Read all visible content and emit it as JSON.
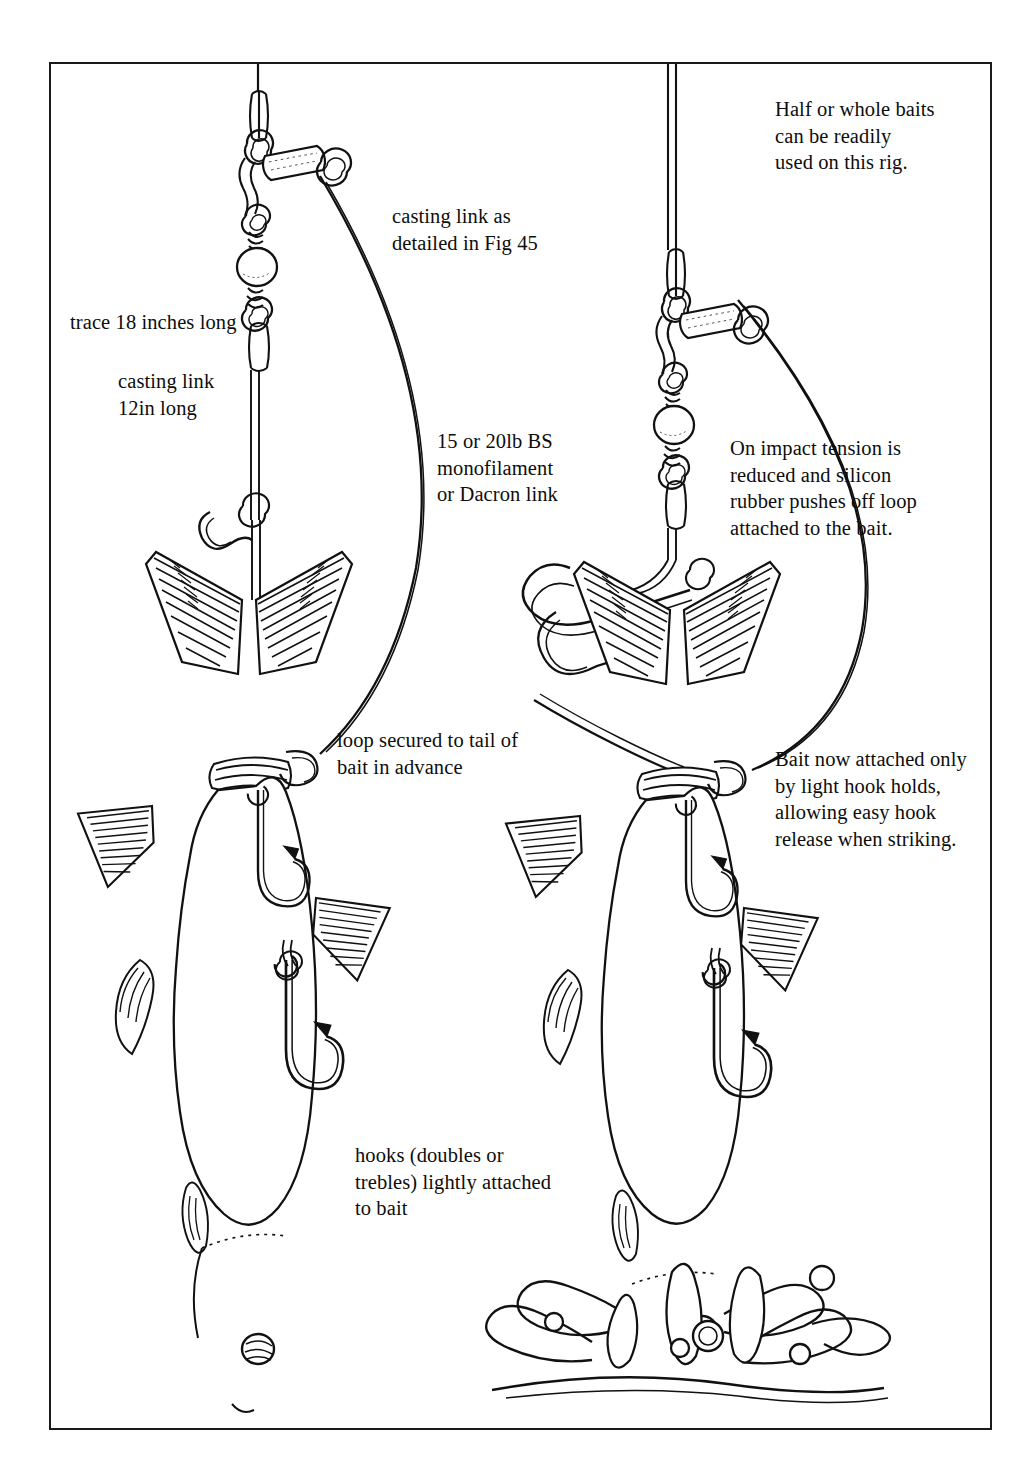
{
  "figure": {
    "domain_type": "technical-line-illustration",
    "frame": {
      "border_color": "#1a1a1a",
      "background": "#ffffff"
    },
    "ink_color": "#111111",
    "panels": [
      {
        "id": "left",
        "name": "rig-before-impact",
        "description": "Bait rigged with loop secured to tail, hooks lightly attached, casting link under tension"
      },
      {
        "id": "right",
        "name": "rig-on-impact",
        "description": "Bait entering water, tension reduced, silicon rubber pushes off loop, bait held by light hook holds"
      }
    ]
  },
  "captions": {
    "half_whole_baits": "Half or whole baits\ncan be readily\nused on this rig.",
    "casting_link_fig": "casting link as\ndetailed in Fig 45",
    "trace_length": "trace 18 inches long",
    "casting_link_length": "casting link\n12in long",
    "mono_link": "15 or 20lb BS\nmonofilament\nor Dacron link",
    "on_impact": "On impact tension is\nreduced and silicon\nrubber pushes off loop\nattached to the bait.",
    "loop_secured": "loop secured to tail of\nbait in advance",
    "bait_now_attached": "Bait now attached only\nby light hook holds,\nallowing easy hook\nrelease when striking.",
    "hooks_attached": "hooks (doubles or\ntrebles) lightly attached\nto bait"
  },
  "components": {
    "main_line": "main-line",
    "swivel": "barrel-swivel",
    "silicon_rubber_sleeve": "silicon-rubber-sleeve",
    "link_swivel": "link-swivel",
    "bead": "bead",
    "trace": "wire-trace",
    "casting_link": "casting-link",
    "release_loop": "release-loop",
    "hook_upper": "upper-hook",
    "hook_lower": "lower-hook",
    "bait_fish": "bait-fish",
    "tail_fin": "caudal-fin",
    "dorsal_fin": "dorsal-fin",
    "anal_fin": "anal-fin",
    "pectoral_fin": "pectoral-fin",
    "fish_eye": "fish-eye",
    "water_splash": "water-splash"
  }
}
